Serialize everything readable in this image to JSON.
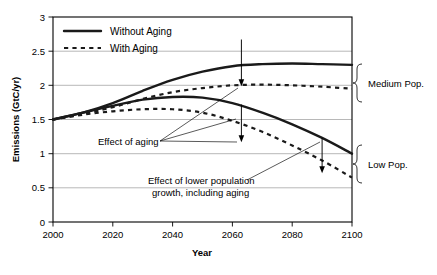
{
  "chart_data": {
    "type": "line",
    "title": "",
    "xlabel": "Year",
    "ylabel": "Emissions (GtC/yr)",
    "xlim": [
      2000,
      2100
    ],
    "ylim": [
      0,
      3
    ],
    "xticks": [
      2000,
      2020,
      2040,
      2060,
      2080,
      2100
    ],
    "yticks": [
      0,
      0.5,
      1,
      1.5,
      2,
      2.5,
      3
    ],
    "ytick_labels": [
      "0",
      "0.5",
      "1",
      "1.5",
      "2",
      "2.5",
      "3"
    ],
    "xtick_labels": [
      "2000",
      "2020",
      "2040",
      "2060",
      "2080",
      "2100"
    ],
    "grid": true,
    "legend_position": "top-left",
    "x": [
      2000,
      2010,
      2020,
      2030,
      2040,
      2050,
      2060,
      2070,
      2080,
      2090,
      2100
    ],
    "series": [
      {
        "name": "Medium Pop., Without Aging",
        "style": "solid",
        "group": "Medium Pop.",
        "values": [
          1.5,
          1.6,
          1.74,
          1.92,
          2.08,
          2.2,
          2.28,
          2.31,
          2.32,
          2.31,
          2.3
        ]
      },
      {
        "name": "Medium Pop., With Aging",
        "style": "dotted",
        "group": "Medium Pop.",
        "values": [
          1.5,
          1.58,
          1.68,
          1.8,
          1.9,
          1.96,
          2.0,
          2.01,
          2.0,
          1.98,
          1.95
        ]
      },
      {
        "name": "Low Pop., Without Aging",
        "style": "solid",
        "group": "Low Pop.",
        "values": [
          1.5,
          1.6,
          1.7,
          1.79,
          1.83,
          1.82,
          1.74,
          1.6,
          1.43,
          1.23,
          1.0
        ]
      },
      {
        "name": "Low Pop., With Aging",
        "style": "dotted",
        "group": "Low Pop.",
        "values": [
          1.5,
          1.57,
          1.62,
          1.65,
          1.65,
          1.6,
          1.48,
          1.32,
          1.12,
          0.9,
          0.65
        ]
      }
    ],
    "legend": [
      {
        "label": "Without Aging",
        "style": "solid"
      },
      {
        "label": "With Aging",
        "style": "dotted"
      }
    ],
    "annotations": [
      {
        "name": "effect-of-aging",
        "text": "Effect of aging"
      },
      {
        "name": "effect-of-lower-population",
        "line1": "Effect of lower population",
        "line2": "growth, including aging"
      }
    ],
    "group_brackets": [
      {
        "label": "Medium Pop."
      },
      {
        "label": "Low Pop."
      }
    ],
    "arrows": [
      {
        "name": "aging-gap-medium",
        "x": 2063,
        "y_from": 2.3,
        "y_to": 2.0
      },
      {
        "name": "aging-gap-low",
        "x": 2063,
        "y_from": 1.72,
        "y_to": 1.38
      },
      {
        "name": "population-gap-low",
        "x": 2090,
        "y_from": 1.22,
        "y_to": 0.88
      }
    ]
  },
  "colors": {
    "series": "#1a1a1a",
    "grid": "#9a9a9a",
    "frame": "#000000",
    "background": "#ffffff"
  }
}
